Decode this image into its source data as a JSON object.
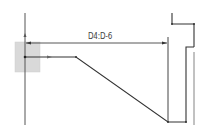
{
  "diagram": {
    "type": "technical-line-drawing",
    "dimension": {
      "label": "D4:D-6",
      "from": [
        26,
        43
      ],
      "to": [
        167,
        43
      ]
    },
    "colors": {
      "line": "#333333",
      "thin_line": "#666666",
      "box_fill": "#d9d9d9",
      "box_stroke": "#c8c8c8",
      "background": "#ffffff"
    },
    "origin_box": {
      "x": 15,
      "y": 42,
      "width": 25,
      "height": 30
    }
  }
}
